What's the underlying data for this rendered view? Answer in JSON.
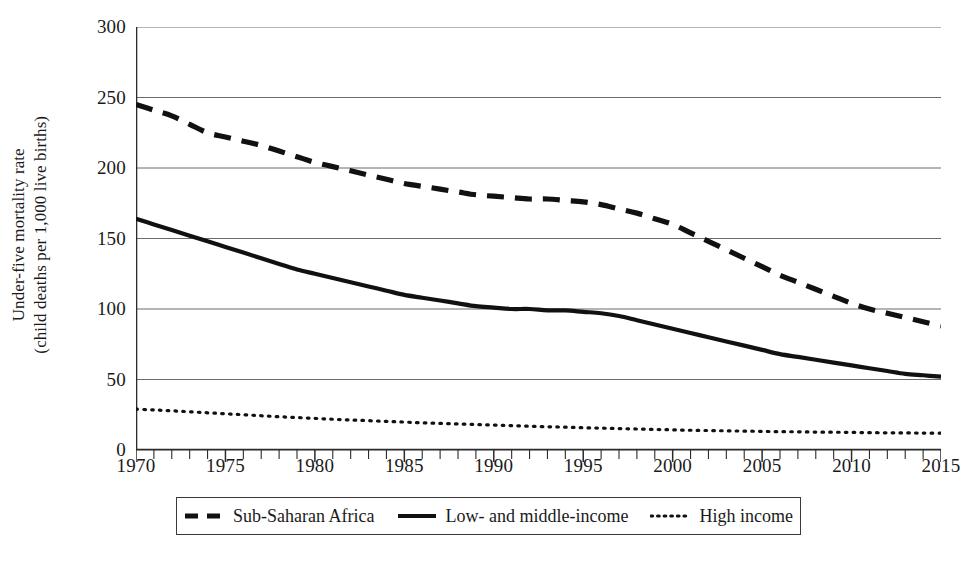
{
  "chart_data": {
    "type": "line",
    "title": "",
    "xlabel": "",
    "ylabel_line1": "Under-five mortality rate",
    "ylabel_line2": "(child deaths per 1,000 live births)",
    "xlim": [
      1970,
      2015
    ],
    "ylim": [
      0,
      300
    ],
    "y_ticks": [
      0,
      50,
      100,
      150,
      200,
      250,
      300
    ],
    "y_tick_labels": [
      "0",
      "50",
      "100",
      "150",
      "200",
      "250",
      "300"
    ],
    "x_ticks": [
      1970,
      1975,
      1980,
      1985,
      1990,
      1995,
      2000,
      2005,
      2010,
      2015
    ],
    "x_tick_labels": [
      "1970",
      "1975",
      "1980",
      "1985",
      "1990",
      "1995",
      "2000",
      "2005",
      "2010",
      "2015"
    ],
    "x_minor_tick_step": 1,
    "grid": "horizontal",
    "legend_position": "bottom",
    "x": [
      1970,
      1971,
      1972,
      1973,
      1974,
      1975,
      1976,
      1977,
      1978,
      1979,
      1980,
      1981,
      1982,
      1983,
      1984,
      1985,
      1986,
      1987,
      1988,
      1989,
      1990,
      1991,
      1992,
      1993,
      1994,
      1995,
      1996,
      1997,
      1998,
      1999,
      2000,
      2001,
      2002,
      2003,
      2004,
      2005,
      2006,
      2007,
      2008,
      2009,
      2010,
      2011,
      2012,
      2013,
      2014,
      2015
    ],
    "series": [
      {
        "name": "Sub-Saharan Africa",
        "style": "dashed",
        "color": "#111111",
        "values": [
          245,
          241,
          237,
          231,
          225,
          222,
          219,
          216,
          212,
          208,
          204,
          201,
          198,
          195,
          192,
          189,
          187,
          185,
          183,
          181,
          180,
          179,
          178,
          178,
          177,
          176,
          174,
          171,
          168,
          164,
          160,
          154,
          148,
          142,
          136,
          130,
          124,
          119,
          114,
          109,
          104,
          100,
          97,
          94,
          91,
          88
        ]
      },
      {
        "name": "Low- and middle-income",
        "style": "solid",
        "color": "#111111",
        "values": [
          164,
          160,
          156,
          152,
          148,
          144,
          140,
          136,
          132,
          128,
          125,
          122,
          119,
          116,
          113,
          110,
          108,
          106,
          104,
          102,
          101,
          100,
          100,
          99,
          99,
          98,
          97,
          95,
          92,
          89,
          86,
          83,
          80,
          77,
          74,
          71,
          68,
          66,
          64,
          62,
          60,
          58,
          56,
          54,
          53,
          52
        ]
      },
      {
        "name": "High income",
        "style": "dotted",
        "color": "#111111",
        "values": [
          29,
          28.4,
          27.8,
          27.1,
          26.4,
          25.7,
          25.0,
          24.3,
          23.6,
          23.0,
          22.4,
          21.8,
          21.3,
          20.8,
          20.3,
          19.8,
          19.3,
          18.9,
          18.5,
          18.1,
          17.7,
          17.3,
          16.9,
          16.5,
          16.2,
          15.8,
          15.5,
          15.2,
          14.9,
          14.6,
          14.3,
          14.0,
          13.8,
          13.6,
          13.4,
          13.2,
          13.0,
          12.9,
          12.7,
          12.6,
          12.5,
          12.3,
          12.2,
          12.1,
          12.0,
          11.9
        ]
      }
    ]
  },
  "legend": {
    "items": [
      {
        "label": "Sub-Saharan Africa",
        "style": "dashed"
      },
      {
        "label": "Low- and middle-income",
        "style": "solid"
      },
      {
        "label": "High income",
        "style": "dotted"
      }
    ]
  },
  "colors": {
    "axis": "#2b2b2b",
    "grid": "#6b6b6b",
    "line": "#111111",
    "text": "#1a1a1a"
  }
}
